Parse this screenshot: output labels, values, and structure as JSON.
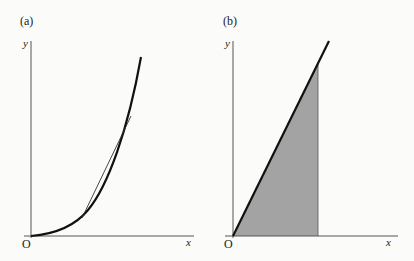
{
  "panels": [
    {
      "id": "a",
      "label": "(a)",
      "axes": {
        "y_label": "y",
        "x_label": "x",
        "origin_label": "O"
      },
      "description": "Increasing convex curve from origin with a tangent line touching it"
    },
    {
      "id": "b",
      "label": "(b)",
      "axes": {
        "y_label": "y",
        "x_label": "x",
        "origin_label": "O"
      },
      "description": "Straight line through origin with shaded triangular area under it up to a vertical line"
    }
  ],
  "colors": {
    "background": "#fbfbfa",
    "axis": "#555555",
    "curve": "#111111",
    "shade": "#a3a3a3"
  }
}
